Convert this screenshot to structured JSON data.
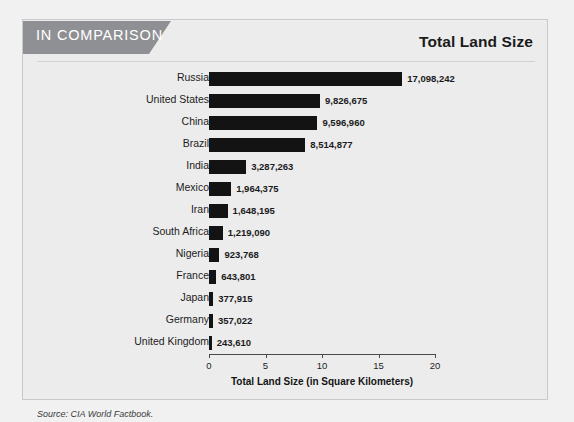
{
  "header": {
    "banner_label": "IN COMPARISON",
    "title": "Total Land Size"
  },
  "source_note": "Source: CIA World Factbook.",
  "chart_data": {
    "type": "bar",
    "orientation": "horizontal",
    "title": "Total Land Size",
    "xlabel": "Total Land Size (in Square Kilometers)",
    "ylabel": "",
    "xlim": [
      0,
      20
    ],
    "xtick_labels": [
      "0",
      "5",
      "10",
      "15",
      "20"
    ],
    "xticks": [
      0,
      5,
      10,
      15,
      20
    ],
    "x_unit_note": "millions of square kilometers",
    "grid": false,
    "legend": false,
    "bar_color": "#131313",
    "categories": [
      "Russia",
      "United States",
      "China",
      "Brazil",
      "India",
      "Mexico",
      "Iran",
      "South Africa",
      "Nigeria",
      "France",
      "Japan",
      "Germany",
      "United Kingdom"
    ],
    "values": [
      17098242,
      9826675,
      9596960,
      8514877,
      3287263,
      1964375,
      1648195,
      1219090,
      923768,
      643801,
      377915,
      357022,
      243610
    ],
    "value_labels": [
      "17,098,242",
      "9,826,675",
      "9,596,960",
      "8,514,877",
      "3,287,263",
      "1,964,375",
      "1,648,195",
      "1,219,090",
      "923,768",
      "643,801",
      "377,915",
      "357,022",
      "243,610"
    ]
  }
}
